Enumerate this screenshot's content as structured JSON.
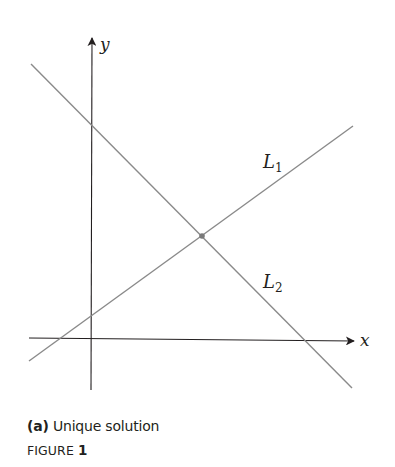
{
  "figure": {
    "axes": {
      "x_label": "x",
      "y_label": "y"
    },
    "lines": [
      {
        "name": "L",
        "subscript": "1",
        "color": "#8a8a8a"
      },
      {
        "name": "L",
        "subscript": "2",
        "color": "#8a8a8a"
      }
    ],
    "intersection_point_color": "#7a7a7a",
    "axis_color": "#231f20"
  },
  "caption": {
    "part_label": "(a)",
    "text": "Unique solution"
  },
  "figure_label": {
    "prefix": "FIGURE",
    "number": "1"
  }
}
